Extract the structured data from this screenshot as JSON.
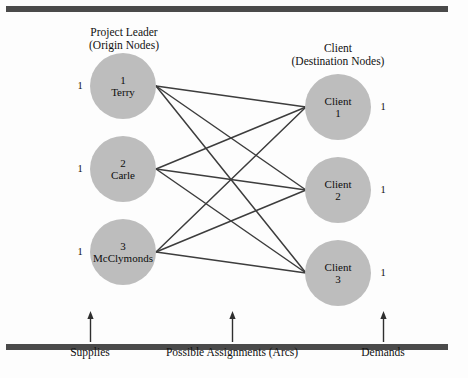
{
  "diagram": {
    "headers": {
      "origin": {
        "line1": "Project Leader",
        "line2": "(Origin Nodes)"
      },
      "destination": {
        "line1": "Client",
        "line2": "(Destination Nodes)"
      }
    },
    "origin_nodes": [
      {
        "id": "1",
        "name": "Terry",
        "supply": "1"
      },
      {
        "id": "2",
        "name": "Carle",
        "supply": "1"
      },
      {
        "id": "3",
        "name": "McClymonds",
        "supply": "1"
      }
    ],
    "destination_nodes": [
      {
        "id": "Client",
        "name": "1",
        "demand": "1"
      },
      {
        "id": "Client",
        "name": "2",
        "demand": "1"
      },
      {
        "id": "Client",
        "name": "3",
        "demand": "1"
      }
    ],
    "callouts": {
      "supplies": "Supplies",
      "arcs": "Possible Assignments (Arcs)",
      "demands": "Demands"
    },
    "colors": {
      "node_fill": "#bdbdbd",
      "arc_stroke": "#3d3d3d",
      "rule": "#4a4a4a",
      "text": "#111111",
      "background": "#fdfdfd"
    },
    "arcs": [
      {
        "from": "1",
        "to": "Client 1"
      },
      {
        "from": "1",
        "to": "Client 2"
      },
      {
        "from": "1",
        "to": "Client 3"
      },
      {
        "from": "2",
        "to": "Client 1"
      },
      {
        "from": "2",
        "to": "Client 2"
      },
      {
        "from": "2",
        "to": "Client 3"
      },
      {
        "from": "3",
        "to": "Client 1"
      },
      {
        "from": "3",
        "to": "Client 2"
      },
      {
        "from": "3",
        "to": "Client 3"
      }
    ]
  }
}
